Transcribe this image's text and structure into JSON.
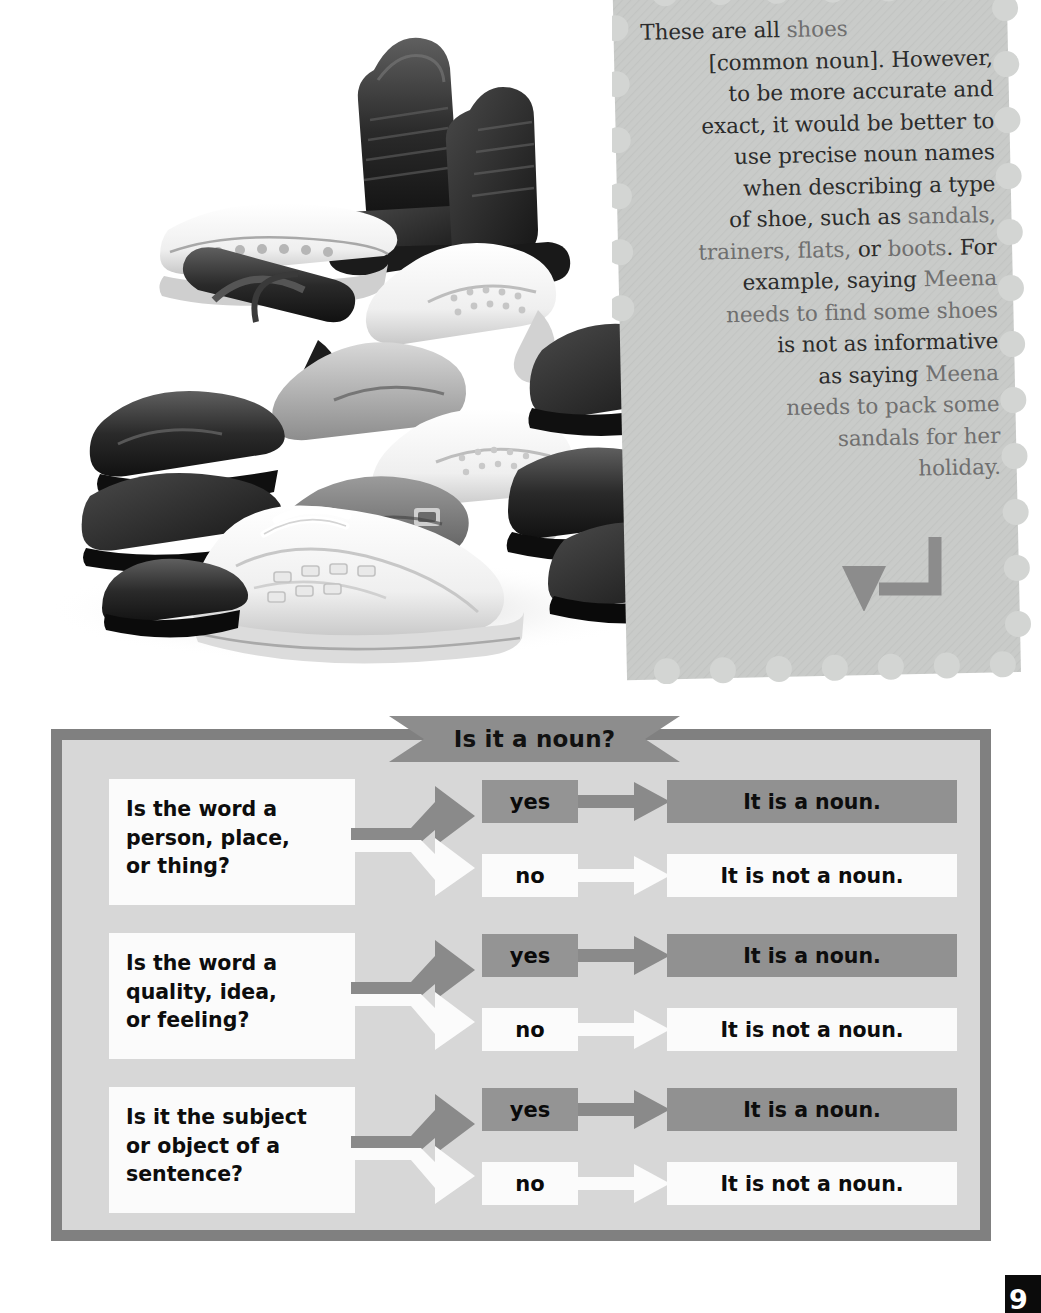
{
  "note": {
    "lines": [
      [
        {
          "t": "These are all ",
          "g": "dark"
        },
        {
          "t": "shoes",
          "g": "mid"
        }
      ],
      [
        {
          "t": "[common noun]. However,",
          "g": "dark"
        }
      ],
      [
        {
          "t": "to be more accurate and",
          "g": "dark"
        }
      ],
      [
        {
          "t": "exact, it would be better to",
          "g": "dark"
        }
      ],
      [
        {
          "t": "use precise noun names",
          "g": "dark"
        }
      ],
      [
        {
          "t": "when describing a type",
          "g": "dark"
        }
      ],
      [
        {
          "t": "of shoe, such as ",
          "g": "dark"
        },
        {
          "t": "sandals,",
          "g": "mid"
        }
      ],
      [
        {
          "t": "trainers, flats, ",
          "g": "mid"
        },
        {
          "t": "or ",
          "g": "dark"
        },
        {
          "t": "boots",
          "g": "mid"
        },
        {
          "t": ". For",
          "g": "dark"
        }
      ],
      [
        {
          "t": "example, saying ",
          "g": "dark"
        },
        {
          "t": "Meena",
          "g": "mid"
        }
      ],
      [
        {
          "t": "needs to find some shoes",
          "g": "mid"
        }
      ],
      [
        {
          "t": "is not as informative",
          "g": "dark"
        }
      ],
      [
        {
          "t": "as saying ",
          "g": "dark"
        },
        {
          "t": "Meena",
          "g": "mid"
        }
      ],
      [
        {
          "t": "needs to pack some",
          "g": "mid"
        }
      ],
      [
        {
          "t": "sandals for her",
          "g": "mid"
        }
      ],
      [
        {
          "t": "holiday.",
          "g": "mid"
        }
      ]
    ],
    "full_text": "These are all shoes [common noun]. However, to be more accurate and exact, it would be better to use precise noun names when describing a type of shoe, such as sandals, trainers, flats, or boots. For example, saying Meena needs to find some shoes is not as informative as saying Meena needs to pack some sandals for her holiday.",
    "arrow_icon": "curved-left-arrow-icon",
    "paper_color": "#c9cbc9"
  },
  "photo": {
    "caption": "pile of assorted shoes",
    "alt_name": "shoes-pile-photo"
  },
  "flowchart": {
    "title": "Is it a noun?",
    "colors": {
      "frame": "#808080",
      "interior": "#d7d7d7",
      "banner": "#8d8d8d",
      "yes_fill": "#949494",
      "no_fill": "#fbfbfb",
      "positive_result_fill": "#919191",
      "negative_result_fill": "#fbfbfb",
      "yes_arrow": "#8a8a8a",
      "no_arrow": "#fbfbfb"
    },
    "rows": [
      {
        "question_lines": [
          "Is the word a",
          "person, place,",
          "or thing?"
        ],
        "question": "Is the word a person, place, or thing?",
        "yes_label": "yes",
        "no_label": "no",
        "yes_result": "It is a noun.",
        "no_result": "It is not a noun."
      },
      {
        "question_lines": [
          "Is the word a",
          "quality, idea,",
          "or feeling?"
        ],
        "question": "Is the word a quality, idea, or feeling?",
        "yes_label": "yes",
        "no_label": "no",
        "yes_result": "It is a noun.",
        "no_result": "It is not a noun."
      },
      {
        "question_lines": [
          "Is it the subject",
          "or object of a",
          "sentence?"
        ],
        "question": "Is it the subject or object of a sentence?",
        "yes_label": "yes",
        "no_label": "no",
        "yes_result": "It is a noun.",
        "no_result": "It is not a noun."
      }
    ]
  },
  "page_badge": {
    "number": "9"
  }
}
